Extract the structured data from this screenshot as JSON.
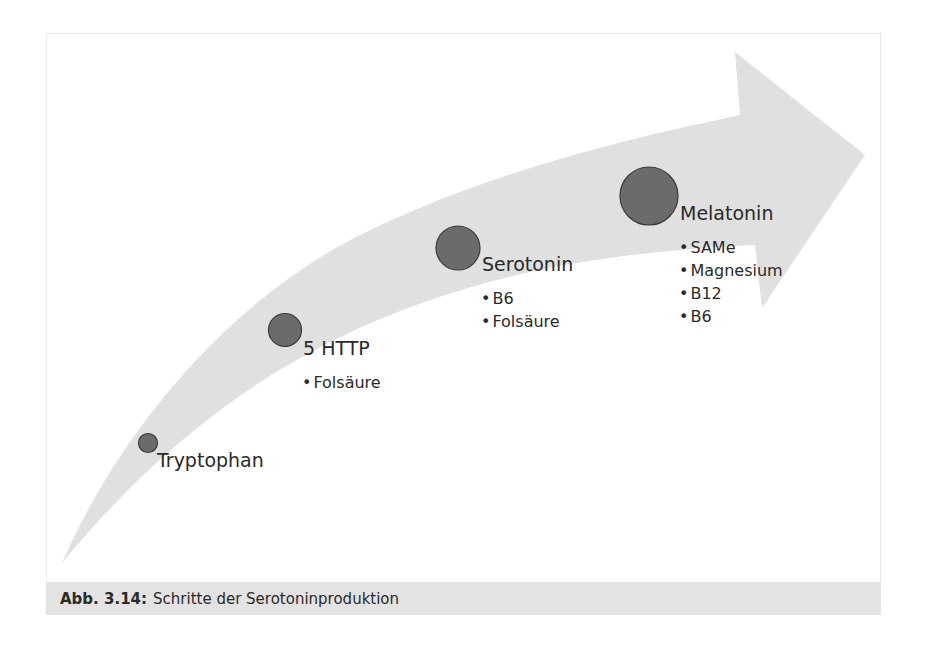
{
  "figure": {
    "caption_label": "Abb. 3.14:",
    "caption_text": "Schritte der Serotoninproduktion",
    "arrow_color": "#e0e0e0",
    "node_fill": "#6b6b6b",
    "node_stroke": "#3a3a3a"
  },
  "steps": [
    {
      "label": "Tryptophan",
      "cofactors": []
    },
    {
      "label": "5 HTTP",
      "cofactors": [
        "Folsäure"
      ]
    },
    {
      "label": "Serotonin",
      "cofactors": [
        "B6",
        "Folsäure"
      ]
    },
    {
      "label": "Melatonin",
      "cofactors": [
        "SAMe",
        "Magnesium",
        "B12",
        "B6"
      ]
    }
  ]
}
